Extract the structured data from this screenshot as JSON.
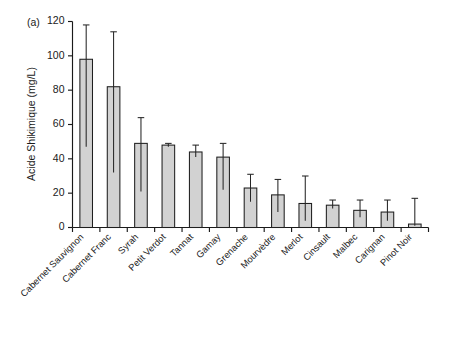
{
  "figure": {
    "panel_label": "(a)",
    "background_color": "#ffffff",
    "bar_fill_color": "#d2d2d2",
    "bar_edge_color": "#1f1f1f",
    "error_bar_color": "#262626"
  },
  "chart_data": {
    "type": "bar",
    "title": "",
    "subtitle": "",
    "panel_label": "(a)",
    "xlabel": "",
    "ylabel": "Acide Shikimique (mg/L)",
    "ylim": [
      0,
      120
    ],
    "yticks": [
      0,
      20,
      40,
      60,
      80,
      100,
      120
    ],
    "ytick_labels": [
      "0",
      "20",
      "40",
      "60",
      "80",
      "100",
      "120"
    ],
    "grid": false,
    "legend": false,
    "legend_position": "none",
    "error_bars": "asymmetric (min-max range)",
    "categories": [
      "Cabernet Sauvignon",
      "Cabernet Franc",
      "Syrah",
      "Petit Verdot",
      "Tannat",
      "Gamay",
      "Grenache",
      "Mourvèdre",
      "Merlot",
      "Cinsault",
      "Malbec",
      "Carignan",
      "Pinot Noir"
    ],
    "values": [
      98,
      82,
      49,
      48,
      44,
      41,
      23,
      19,
      14,
      13,
      10,
      9,
      2
    ],
    "error_low": [
      47,
      32,
      21,
      47,
      41,
      22,
      15,
      9,
      4,
      11,
      6,
      4,
      1
    ],
    "error_high": [
      118,
      114,
      64,
      49,
      48,
      49,
      31,
      28,
      30,
      16,
      16,
      16,
      17
    ]
  }
}
